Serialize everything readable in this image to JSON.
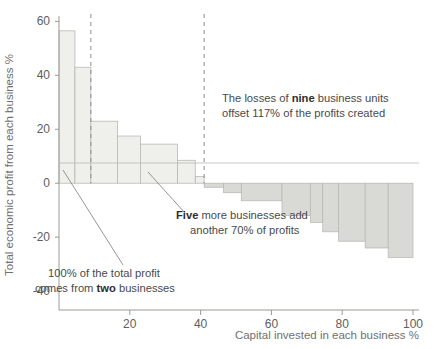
{
  "chart_data": {
    "type": "bar",
    "title": "",
    "subtitle": "",
    "xlabel": "Capital invested in each business %",
    "ylabel": "Total economic profit from each business %",
    "xlim": [
      0,
      100
    ],
    "ylim": [
      -47,
      62
    ],
    "grid": false,
    "legend": null,
    "orientation": "waterfall-style profit/loss by cumulative capital",
    "note": "Each bar spans a capital-invested interval on x; bar height is that business unit's economic profit %",
    "xticks": [
      0,
      20,
      40,
      60,
      80,
      100
    ],
    "xtick_labels": [
      "0",
      "20",
      "40",
      "60",
      "80",
      "100"
    ],
    "yticks": [
      60,
      40,
      20,
      0,
      -20,
      -40
    ],
    "ytick_labels": [
      "60",
      "40",
      "20",
      "0",
      "-20",
      "-40"
    ],
    "bars": [
      {
        "name": "unit-1",
        "x_start": 0.0,
        "x_end": 4.5,
        "value": 56.5
      },
      {
        "name": "unit-2",
        "x_start": 4.5,
        "x_end": 9.0,
        "value": 43.0
      },
      {
        "name": "unit-3",
        "x_start": 9.0,
        "x_end": 16.5,
        "value": 23.0
      },
      {
        "name": "unit-4",
        "x_start": 16.5,
        "x_end": 23.0,
        "value": 17.5
      },
      {
        "name": "unit-5",
        "x_start": 23.0,
        "x_end": 33.5,
        "value": 14.5
      },
      {
        "name": "unit-6",
        "x_start": 33.5,
        "x_end": 38.5,
        "value": 8.5
      },
      {
        "name": "unit-7",
        "x_start": 38.5,
        "x_end": 41.0,
        "value": 2.5
      },
      {
        "name": "unit-8",
        "x_start": 41.0,
        "x_end": 46.5,
        "value": -1.5
      },
      {
        "name": "unit-9",
        "x_start": 46.5,
        "x_end": 51.5,
        "value": -3.5
      },
      {
        "name": "unit-10",
        "x_start": 51.5,
        "x_end": 63.0,
        "value": -6.5
      },
      {
        "name": "unit-11",
        "x_start": 63.0,
        "x_end": 71.0,
        "value": -12.0
      },
      {
        "name": "unit-12",
        "x_start": 71.0,
        "x_end": 74.5,
        "value": -14.5
      },
      {
        "name": "unit-13",
        "x_start": 74.5,
        "x_end": 79.0,
        "value": -18.0
      },
      {
        "name": "unit-14",
        "x_start": 79.0,
        "x_end": 86.5,
        "value": -21.5
      },
      {
        "name": "unit-15",
        "x_start": 86.5,
        "x_end": 93.0,
        "value": -24.0
      },
      {
        "name": "unit-16",
        "x_start": 93.0,
        "x_end": 100.0,
        "value": -27.5
      }
    ],
    "reference_lines": [
      {
        "name": "divider-two-businesses",
        "x": 9.0,
        "style": "dashed"
      },
      {
        "name": "divider-seven-businesses",
        "x": 41.0,
        "style": "dashed"
      }
    ],
    "annotations": [
      {
        "name": "annotation-losses",
        "lines": [
          [
            {
              "text": "The losses of ",
              "bold": false
            },
            {
              "text": "nine",
              "bold": true
            },
            {
              "text": " business units",
              "bold": false
            }
          ],
          [
            {
              "text": "offset 117% of the profits created",
              "bold": false
            }
          ]
        ]
      },
      {
        "name": "annotation-five-more",
        "lines": [
          [
            {
              "text": "Five",
              "bold": true
            },
            {
              "text": " more businesses add",
              "bold": false
            }
          ],
          [
            {
              "text": "another 70% of profits",
              "bold": false
            }
          ]
        ]
      },
      {
        "name": "annotation-hundred-percent",
        "lines": [
          [
            {
              "text": "100% of the total profit",
              "bold": false
            }
          ],
          [
            {
              "text": "comes from ",
              "bold": false
            },
            {
              "text": "two",
              "bold": true
            },
            {
              "text": " businesses",
              "bold": false
            }
          ]
        ]
      }
    ],
    "colors": {
      "bar_fill_positive": "#efefeb",
      "bar_fill_negative": "#d9d9d6",
      "bar_stroke": "#b9b9b4",
      "axis": "#9a9a95",
      "dashed_line": "#8c8c88",
      "text": "#4a4a4a",
      "background": "#ffffff"
    }
  }
}
